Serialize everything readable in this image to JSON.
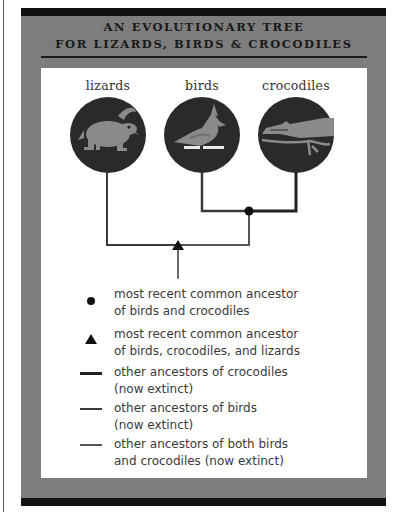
{
  "title": {
    "line1": "AN EVOLUTIONARY TREE",
    "line2": "FOR LIZARDS, BIRDS & CROCODILES"
  },
  "species": [
    {
      "label": "lizards",
      "icon": "lizard-icon"
    },
    {
      "label": "birds",
      "icon": "bird-icon"
    },
    {
      "label": "crocodiles",
      "icon": "crocodile-icon"
    }
  ],
  "legend": [
    {
      "marker": "dot",
      "text": "most recent common ancestor\nof birds and crocodiles"
    },
    {
      "marker": "triangle",
      "text": "most recent common ancestor\nof birds, crocodiles, and lizards"
    },
    {
      "marker": "line-dark",
      "text": "other ancestors of crocodiles\n(now extinct)"
    },
    {
      "marker": "line-medium",
      "text": "other ancestors of birds\n(now extinct)"
    },
    {
      "marker": "line-light",
      "text": "other ancestors of both birds\nand crocodiles (now extinct)"
    }
  ],
  "colors": {
    "frame": "#7d7d7d",
    "bar": "#111111",
    "circle": "#2a2a2a",
    "animal": "#8a8a8a",
    "line_dark": "#222222",
    "line_medium": "#3a3a3a",
    "line_light": "#555555"
  }
}
